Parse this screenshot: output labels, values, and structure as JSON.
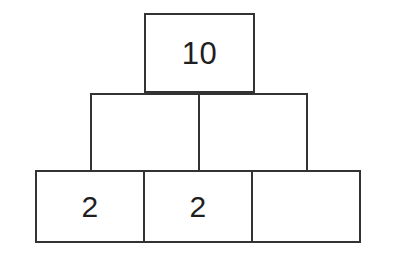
{
  "figure": {
    "kind": "number-pyramid",
    "background_color": "#ffffff",
    "stroke_color": "#333333",
    "text_color": "#1f1f1f",
    "stroke_width_px": 2,
    "rows": [
      {
        "name": "top-row",
        "cells": [
          {
            "name": "apex-cell",
            "value": "10"
          }
        ]
      },
      {
        "name": "middle-row",
        "cells": [
          {
            "name": "middle-left-cell",
            "value": ""
          },
          {
            "name": "middle-right-cell",
            "value": ""
          }
        ]
      },
      {
        "name": "bottom-row",
        "cells": [
          {
            "name": "bottom-left-cell",
            "value": "2"
          },
          {
            "name": "bottom-center-cell",
            "value": "2"
          },
          {
            "name": "bottom-right-cell",
            "value": ""
          }
        ]
      }
    ]
  }
}
